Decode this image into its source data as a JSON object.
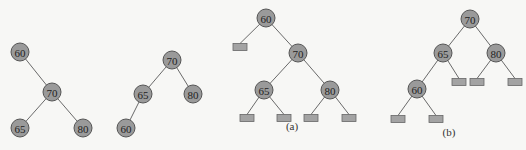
{
  "colors": {
    "background": "#f7f7f5",
    "node_fill": "#9a9a9a",
    "node_stroke": "#555555",
    "null_leaf_fill": "#a3a3a3",
    "edge": "#6a6a6a"
  },
  "trees": [
    {
      "id": "tree-1",
      "caption": "",
      "nodes": [
        {
          "id": "n60",
          "label": "60",
          "x": 20,
          "y": 52
        },
        {
          "id": "n70",
          "label": "70",
          "x": 52,
          "y": 92
        },
        {
          "id": "n65",
          "label": "65",
          "x": 20,
          "y": 128
        },
        {
          "id": "n80",
          "label": "80",
          "x": 83,
          "y": 128
        }
      ],
      "edges": [
        [
          "n60",
          "n70"
        ],
        [
          "n70",
          "n65"
        ],
        [
          "n70",
          "n80"
        ]
      ],
      "null_leaves": []
    },
    {
      "id": "tree-2",
      "caption": "",
      "nodes": [
        {
          "id": "n70",
          "label": "70",
          "x": 172,
          "y": 60
        },
        {
          "id": "n65",
          "label": "65",
          "x": 143,
          "y": 94
        },
        {
          "id": "n80",
          "label": "80",
          "x": 193,
          "y": 94
        },
        {
          "id": "n60",
          "label": "60",
          "x": 126,
          "y": 128
        }
      ],
      "edges": [
        [
          "n70",
          "n65"
        ],
        [
          "n70",
          "n80"
        ],
        [
          "n65",
          "n60"
        ]
      ],
      "null_leaves": []
    },
    {
      "id": "tree-a",
      "caption": "(a)",
      "caption_x": 292,
      "caption_y": 130,
      "nodes": [
        {
          "id": "n60",
          "label": "60",
          "x": 266,
          "y": 18
        },
        {
          "id": "n70",
          "label": "70",
          "x": 298,
          "y": 53
        },
        {
          "id": "n65",
          "label": "65",
          "x": 264,
          "y": 90
        },
        {
          "id": "n80",
          "label": "80",
          "x": 330,
          "y": 90
        }
      ],
      "edges": [
        [
          "n60",
          "n70"
        ],
        [
          "n70",
          "n65"
        ],
        [
          "n70",
          "n80"
        ]
      ],
      "null_leaves": [
        {
          "parent": "n60",
          "x": 240,
          "y": 47
        },
        {
          "parent": "n65",
          "x": 247,
          "y": 118
        },
        {
          "parent": "n65",
          "x": 284,
          "y": 118
        },
        {
          "parent": "n80",
          "x": 311,
          "y": 118
        },
        {
          "parent": "n80",
          "x": 349,
          "y": 118
        }
      ]
    },
    {
      "id": "tree-b",
      "caption": "(b)",
      "caption_x": 449,
      "caption_y": 136,
      "nodes": [
        {
          "id": "n70",
          "label": "70",
          "x": 470,
          "y": 19
        },
        {
          "id": "n65",
          "label": "65",
          "x": 443,
          "y": 53
        },
        {
          "id": "n80",
          "label": "80",
          "x": 496,
          "y": 53
        },
        {
          "id": "n60",
          "label": "60",
          "x": 417,
          "y": 89
        }
      ],
      "edges": [
        [
          "n70",
          "n65"
        ],
        [
          "n70",
          "n80"
        ],
        [
          "n65",
          "n60"
        ]
      ],
      "null_leaves": [
        {
          "parent": "n65",
          "x": 459,
          "y": 82
        },
        {
          "parent": "n80",
          "x": 477,
          "y": 82
        },
        {
          "parent": "n80",
          "x": 515,
          "y": 82
        },
        {
          "parent": "n60",
          "x": 398,
          "y": 119
        },
        {
          "parent": "n60",
          "x": 436,
          "y": 119
        }
      ]
    }
  ]
}
